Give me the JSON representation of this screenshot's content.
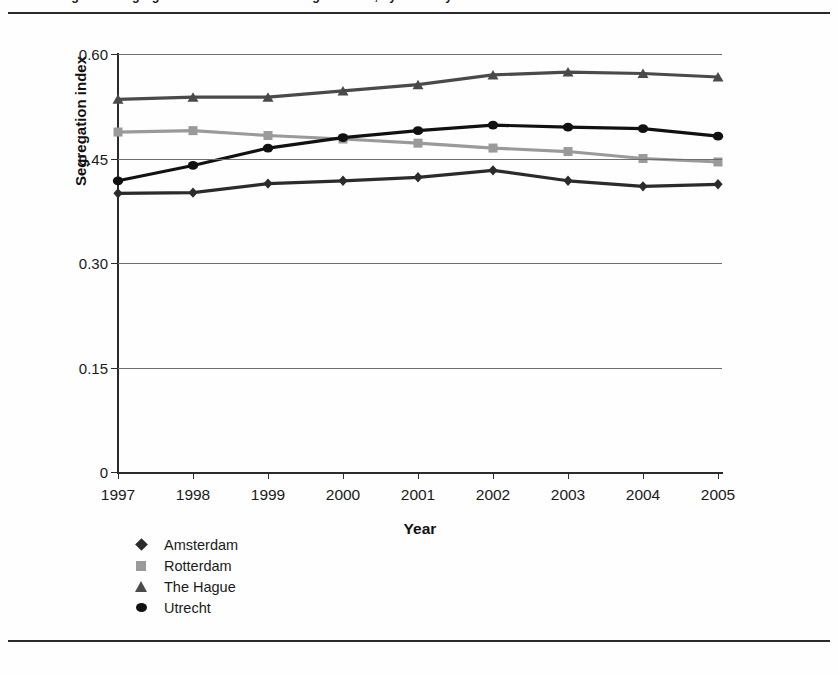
{
  "figure": {
    "clipped_caption": "Figure 1. Segregation index of the four largest cities, by ethnicity"
  },
  "chart_data": {
    "type": "line",
    "title": "",
    "xlabel": "Year",
    "ylabel": "Segregation index",
    "x": [
      1997,
      1998,
      1999,
      2000,
      2001,
      2002,
      2003,
      2004,
      2005
    ],
    "categories": [
      "1997",
      "1998",
      "1999",
      "2000",
      "2001",
      "2002",
      "2003",
      "2004",
      "2005"
    ],
    "ylim": [
      0,
      0.6
    ],
    "yticks": [
      0,
      0.15,
      0.3,
      0.45,
      0.6
    ],
    "ytick_labels": [
      "0",
      "0.15",
      "0.30",
      "0.45",
      "0.60"
    ],
    "grid": "horizontal",
    "legend_position": "below-left",
    "series": [
      {
        "name": "Amsterdam",
        "marker": "diamond",
        "color": "#2b2b2b",
        "values": [
          0.4,
          0.401,
          0.414,
          0.418,
          0.423,
          0.433,
          0.418,
          0.41,
          0.413
        ]
      },
      {
        "name": "Rotterdam",
        "marker": "square",
        "color": "#9a9a9a",
        "values": [
          0.488,
          0.49,
          0.483,
          0.478,
          0.472,
          0.465,
          0.46,
          0.45,
          0.445
        ]
      },
      {
        "name": "The Hague",
        "marker": "triangle",
        "color": "#4a4a4a",
        "values": [
          0.535,
          0.538,
          0.538,
          0.547,
          0.556,
          0.57,
          0.574,
          0.572,
          0.567
        ]
      },
      {
        "name": "Utrecht",
        "marker": "circle",
        "color": "#111111",
        "values": [
          0.418,
          0.44,
          0.465,
          0.48,
          0.49,
          0.498,
          0.495,
          0.493,
          0.482
        ]
      }
    ]
  }
}
